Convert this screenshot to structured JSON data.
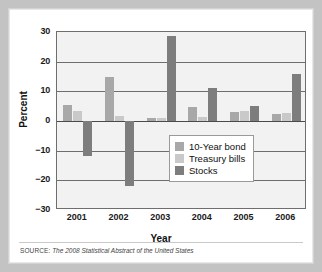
{
  "figure": {
    "source_label": "SOURCE:",
    "source_text": "The 2008 Statistical Abstract of the United States"
  },
  "colors": {
    "bond": "#a8a8a8",
    "tbills": "#c9c9c9",
    "stocks": "#7d7d7d",
    "axis": "#6e6e6e",
    "plot_bg": "#f2f2f2",
    "card_bg": "#ffffff",
    "page_bg": "#c3c3c3"
  },
  "chart_data": {
    "type": "bar",
    "title": "",
    "xlabel": "Year",
    "ylabel": "Percent",
    "categories": [
      "2001",
      "2002",
      "2003",
      "2004",
      "2005",
      "2006"
    ],
    "ylim": [
      -30,
      30
    ],
    "yticks": [
      30,
      20,
      10,
      0,
      -10,
      -20,
      -30
    ],
    "ytick_labels": [
      "30",
      "20",
      "10",
      "0",
      "−10",
      "−20",
      "−30"
    ],
    "grid": true,
    "legend_position": "inside-lower-right",
    "series": [
      {
        "name": "10-Year bond",
        "color_key": "bond",
        "values": [
          5.5,
          15.0,
          1.0,
          4.8,
          3.2,
          2.5
        ]
      },
      {
        "name": "Treasury bills",
        "color_key": "tbills",
        "values": [
          3.4,
          1.7,
          1.0,
          1.4,
          3.5,
          2.8
        ]
      },
      {
        "name": "Stocks",
        "color_key": "stocks",
        "values": [
          -11.8,
          -22.0,
          28.7,
          11.0,
          5.0,
          16.0
        ]
      }
    ]
  }
}
